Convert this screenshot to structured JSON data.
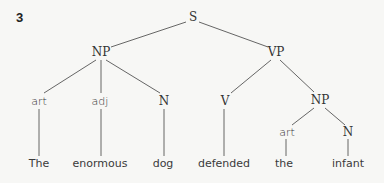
{
  "figure_number": "3",
  "tree": {
    "root": "S",
    "nodes": {
      "s": {
        "label": "S",
        "x": 193,
        "y": 11
      },
      "np1": {
        "label": "NP",
        "x": 101,
        "y": 46
      },
      "vp": {
        "label": "VP",
        "x": 276,
        "y": 46
      },
      "art1": {
        "label": "art",
        "x": 39,
        "y": 95
      },
      "adj": {
        "label": "adj",
        "x": 100,
        "y": 95
      },
      "n1": {
        "label": "N",
        "x": 164,
        "y": 95
      },
      "v": {
        "label": "V",
        "x": 225,
        "y": 95
      },
      "np2": {
        "label": "NP",
        "x": 320,
        "y": 94
      },
      "art2": {
        "label": "art",
        "x": 287,
        "y": 126
      },
      "n2": {
        "label": "N",
        "x": 348,
        "y": 126
      }
    },
    "words": [
      {
        "text": "The",
        "x": 39
      },
      {
        "text": "enormous",
        "x": 100
      },
      {
        "text": "dog",
        "x": 163
      },
      {
        "text": "defended",
        "x": 224
      },
      {
        "text": "the",
        "x": 284
      },
      {
        "text": "infant",
        "x": 348
      }
    ],
    "words_y": 157,
    "line_color": "#555555"
  }
}
